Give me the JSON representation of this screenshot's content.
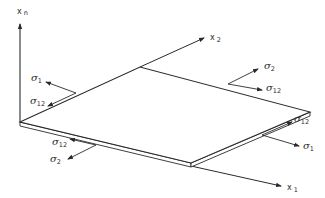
{
  "figure": {
    "axes": {
      "normal": {
        "symbol": "x",
        "subscript": "n"
      },
      "x2": {
        "symbol": "x",
        "subscript": "2"
      },
      "x1": {
        "symbol": "x",
        "subscript": "1"
      }
    },
    "stress_labels": {
      "left_back_edge": [
        {
          "symbol": "σ",
          "subscript": "1"
        },
        {
          "symbol": "σ",
          "subscript": "12"
        }
      ],
      "right_back_edge": [
        {
          "symbol": "σ",
          "subscript": "2"
        },
        {
          "symbol": "σ",
          "subscript": "12"
        }
      ],
      "right_front_edge": [
        {
          "symbol": "σ",
          "subscript": "12"
        },
        {
          "symbol": "σ",
          "subscript": "1"
        }
      ],
      "left_front_edge": [
        {
          "symbol": "σ",
          "subscript": "12"
        },
        {
          "symbol": "σ",
          "subscript": "2"
        }
      ]
    },
    "colors": {
      "line": "#2a2a2a",
      "background": "#ffffff"
    }
  }
}
